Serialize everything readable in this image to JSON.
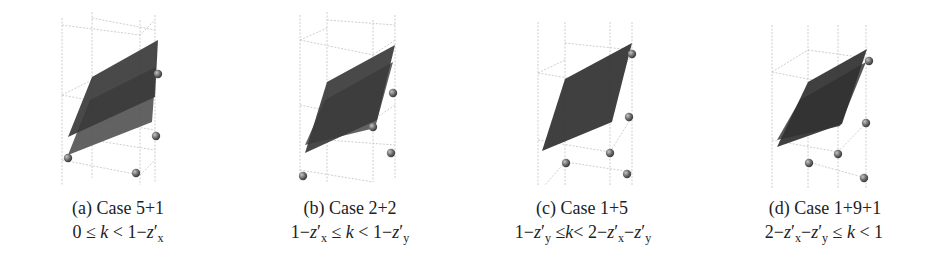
{
  "figure": {
    "panels": [
      {
        "label": "(a)",
        "title": "Case 5+1",
        "title_full": "(a) Case 5+1",
        "condition": "0 ≤ k < 1−z′x",
        "condition_parts": {
          "left": "0 ≤ ",
          "k": "k",
          "mid": " < 1−",
          "z": "z′",
          "zsub": "x"
        },
        "center_x": 118,
        "grid_verticals": [
          [
            62,
            18,
            62,
            185
          ],
          [
            92,
            12,
            92,
            178
          ],
          [
            140,
            20,
            140,
            185
          ],
          [
            155,
            15,
            155,
            183
          ]
        ],
        "grid_lines": [
          [
            62,
            25,
            140,
            35
          ],
          [
            92,
            18,
            155,
            30
          ],
          [
            62,
            95,
            140,
            110
          ],
          [
            62,
            160,
            140,
            175
          ],
          [
            92,
            120,
            155,
            130
          ],
          [
            140,
            35,
            155,
            20
          ],
          [
            140,
            110,
            155,
            95
          ],
          [
            140,
            175,
            155,
            160
          ],
          [
            92,
            140,
            155,
            150
          ],
          [
            62,
            95,
            92,
            80
          ]
        ],
        "planes": [
          {
            "points": [
              [
                92,
                77
              ],
              [
                158,
                40
              ],
              [
                155,
                97
              ],
              [
                68,
                137
              ]
            ],
            "shade": "#3a3a3a"
          },
          {
            "points": [
              [
                90,
                100
              ],
              [
                156,
                67
              ],
              [
                152,
                122
              ],
              [
                68,
                155
              ]
            ],
            "shade": "#555555"
          }
        ],
        "spheres": [
          [
            68,
            158
          ],
          [
            158,
            74
          ],
          [
            156,
            136
          ],
          [
            136,
            173
          ]
        ]
      },
      {
        "label": "(b)",
        "title": "Case 2+2",
        "title_full": "(b) Case 2+2",
        "condition": "1−z′x ≤ k < 1−z′y",
        "center_x": 350,
        "grid_verticals": [
          [
            300,
            15,
            300,
            180
          ],
          [
            327,
            12,
            327,
            182
          ],
          [
            373,
            20,
            373,
            182
          ],
          [
            395,
            15,
            395,
            178
          ]
        ],
        "grid_lines": [
          [
            300,
            40,
            373,
            55
          ],
          [
            327,
            20,
            395,
            25
          ],
          [
            300,
            105,
            373,
            120
          ],
          [
            300,
            170,
            373,
            182
          ],
          [
            327,
            140,
            395,
            145
          ],
          [
            373,
            55,
            395,
            40
          ],
          [
            373,
            120,
            395,
            105
          ],
          [
            300,
            40,
            327,
            28
          ]
        ],
        "planes": [
          {
            "points": [
              [
                327,
                82
              ],
              [
                395,
                45
              ],
              [
                377,
                120
              ],
              [
                305,
                153
              ]
            ],
            "shade": "#3a3a3a"
          },
          {
            "points": [
              [
                325,
                100
              ],
              [
                393,
                62
              ],
              [
                375,
                128
              ],
              [
                305,
                145
              ]
            ],
            "shade": "#555555"
          }
        ],
        "spheres": [
          [
            303,
            176
          ],
          [
            393,
            93
          ],
          [
            373,
            127
          ],
          [
            391,
            153
          ]
        ]
      },
      {
        "label": "(c)",
        "title": "Case 1+5",
        "title_full": "(c) Case 1+5",
        "condition": "1−z′y ≤ k < 2−z′x−z′y",
        "center_x": 580,
        "grid_verticals": [
          [
            538,
            22,
            538,
            185
          ],
          [
            565,
            22,
            565,
            185
          ],
          [
            610,
            22,
            610,
            185
          ],
          [
            632,
            22,
            632,
            185
          ]
        ],
        "grid_lines": [
          [
            538,
            73,
            610,
            85
          ],
          [
            565,
            43,
            632,
            50
          ],
          [
            538,
            140,
            610,
            152
          ],
          [
            565,
            162,
            632,
            172
          ],
          [
            610,
            85,
            632,
            55
          ],
          [
            610,
            152,
            632,
            117
          ],
          [
            538,
            73,
            565,
            60
          ],
          [
            565,
            162,
            545,
            185
          ]
        ],
        "planes": [
          {
            "points": [
              [
                565,
                79
              ],
              [
                632,
                43
              ],
              [
                612,
                122
              ],
              [
                542,
                151
              ]
            ],
            "shade": "#303030"
          }
        ],
        "spheres": [
          [
            632,
            54
          ],
          [
            629,
            117
          ],
          [
            610,
            153
          ],
          [
            566,
            163
          ],
          [
            627,
            174
          ]
        ]
      },
      {
        "label": "(d)",
        "title": "Case 1+9+1",
        "title_full": "(d) Case 1+9+1",
        "condition": "2−z′x−z′y ≤ k < 1",
        "center_x": 820,
        "grid_verticals": [
          [
            772,
            25,
            772,
            188
          ],
          [
            808,
            25,
            808,
            188
          ],
          [
            838,
            25,
            838,
            188
          ],
          [
            866,
            25,
            866,
            188
          ]
        ],
        "grid_lines": [
          [
            772,
            72,
            838,
            85
          ],
          [
            808,
            50,
            866,
            58
          ],
          [
            772,
            140,
            838,
            152
          ],
          [
            808,
            162,
            866,
            178
          ],
          [
            838,
            85,
            866,
            58
          ],
          [
            838,
            152,
            866,
            123
          ],
          [
            772,
            72,
            808,
            50
          ]
        ],
        "planes": [
          {
            "points": [
              [
                808,
                82
              ],
              [
                867,
                49
              ],
              [
                842,
                124
              ],
              [
                777,
                147
              ]
            ],
            "shade": "#303030"
          },
          {
            "points": [
              [
                800,
                100
              ],
              [
                866,
                62
              ],
              [
                840,
                126
              ],
              [
                777,
                140
              ]
            ],
            "shade": "#4a4a4a"
          }
        ],
        "spheres": [
          [
            869,
            61
          ],
          [
            866,
            123
          ],
          [
            838,
            154
          ],
          [
            809,
            163
          ],
          [
            864,
            178
          ]
        ]
      }
    ],
    "colors": {
      "grid": "#c8c8c8",
      "sphere": "#6a6a6a",
      "sphere_highlight": "#b0b0b0",
      "text": "#222222"
    }
  }
}
